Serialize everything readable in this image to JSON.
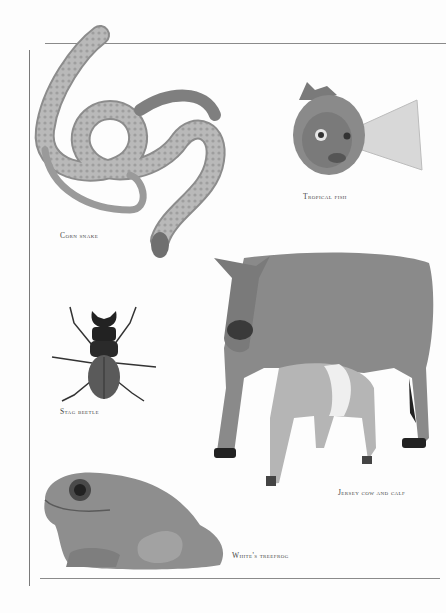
{
  "page": {
    "type": "scanned book page",
    "background": "#fdfdfd",
    "rule_color": "#8a8a8a"
  },
  "photos": [
    {
      "id": "corn-snake",
      "caption": "Corn snake"
    },
    {
      "id": "tropical-fish",
      "caption": "Tropical fish"
    },
    {
      "id": "stag-beetle",
      "caption": "Stag beetle"
    },
    {
      "id": "jersey-cow-and-calf",
      "caption": "Jersey cow and calf"
    },
    {
      "id": "whites-treefrog",
      "caption": "White's treefrog"
    }
  ]
}
